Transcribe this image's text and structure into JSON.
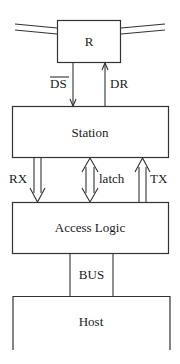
{
  "diagram": {
    "nodes": [
      {
        "id": "r",
        "label": "R"
      },
      {
        "id": "station",
        "label": "Station"
      },
      {
        "id": "access_logic",
        "label": "Access Logic"
      },
      {
        "id": "bus",
        "label": "BUS"
      },
      {
        "id": "host",
        "label": "Host"
      }
    ],
    "edges": [
      {
        "id": "ds",
        "label": "DS",
        "overline": true,
        "from": "r",
        "to": "station",
        "direction": "down"
      },
      {
        "id": "dr",
        "label": "DR",
        "from": "station",
        "to": "r",
        "direction": "up"
      },
      {
        "id": "rx",
        "label": "RX",
        "from": "station",
        "to": "access_logic",
        "direction": "down",
        "style": "wide-arrow"
      },
      {
        "id": "latch",
        "label": "latch",
        "from": "station",
        "to": "access_logic",
        "direction": "both",
        "style": "wide-arrow"
      },
      {
        "id": "tx",
        "label": "TX",
        "from": "access_logic",
        "to": "station",
        "direction": "up",
        "style": "wide-arrow"
      }
    ]
  }
}
